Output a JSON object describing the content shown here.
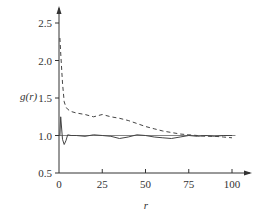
{
  "chart_data": {
    "type": "line",
    "title": "",
    "xlabel": "r",
    "ylabel": "g(r)",
    "xlim": [
      0,
      105
    ],
    "ylim": [
      0.5,
      2.6
    ],
    "x_ticks": [
      0,
      25,
      50,
      75,
      100
    ],
    "x_tick_labels": [
      "0",
      "25",
      "50",
      "75",
      "100"
    ],
    "y_ticks": [
      0.5,
      1.0,
      1.5,
      2.0,
      2.5
    ],
    "y_tick_labels": [
      "0.5",
      "1.0",
      "1.5",
      "2.0",
      "2.5"
    ],
    "grid": false,
    "legend": null,
    "reference_line": {
      "y": 1.0,
      "x_range": [
        0,
        102
      ],
      "style": "thin solid"
    },
    "series": [
      {
        "name": "dashed",
        "style": "dashed",
        "x": [
          0.5,
          1,
          2,
          3,
          4,
          5,
          7,
          10,
          15,
          20,
          25,
          30,
          35,
          40,
          45,
          50,
          55,
          60,
          65,
          70,
          75,
          80,
          85,
          90,
          95,
          100
        ],
        "y": [
          2.3,
          2.1,
          1.7,
          1.45,
          1.38,
          1.35,
          1.32,
          1.3,
          1.28,
          1.25,
          1.28,
          1.25,
          1.23,
          1.2,
          1.16,
          1.12,
          1.09,
          1.06,
          1.04,
          1.02,
          1.01,
          1.0,
          0.99,
          0.99,
          0.98,
          0.97
        ]
      },
      {
        "name": "solid",
        "style": "solid",
        "x": [
          0.5,
          1,
          1.5,
          2,
          3,
          4,
          5,
          7,
          10,
          15,
          20,
          25,
          30,
          35,
          40,
          45,
          50,
          55,
          60,
          65,
          70,
          75,
          80,
          85,
          90,
          95,
          100
        ],
        "y": [
          1.0,
          1.25,
          1.1,
          0.95,
          0.88,
          0.93,
          1.01,
          1.0,
          1.0,
          0.99,
          1.01,
          1.0,
          0.99,
          0.96,
          0.98,
          1.01,
          1.0,
          0.98,
          0.97,
          0.96,
          0.98,
          1.0,
          0.99,
          1.0,
          0.99,
          1.0,
          1.0
        ]
      }
    ]
  }
}
